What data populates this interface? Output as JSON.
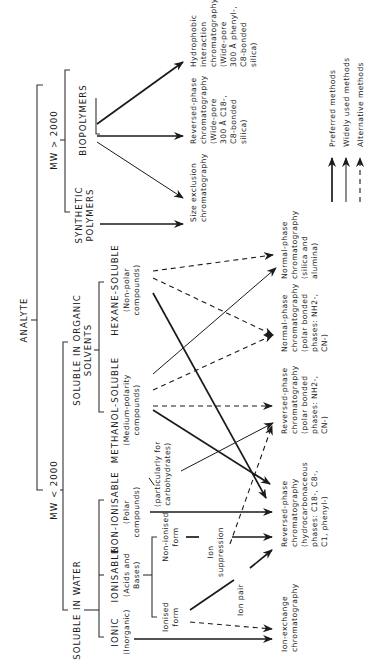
{
  "root": "ANALYTE",
  "branches": {
    "mw_high": "MW > 2000",
    "mw_low": "MW < 2000"
  },
  "categories": {
    "biopolymers": [
      "BIOPOLYMERS"
    ],
    "synthetic": [
      "SYNTHETIC",
      "POLYMERS"
    ],
    "organic": [
      "SOLUBLE IN ORGANIC",
      "SOLVENTS"
    ],
    "water": [
      "SOLUBLE IN WATER"
    ],
    "hexane": [
      "HEXANE-SOLUBLE",
      "(Non-polar",
      "compounds)"
    ],
    "methanol": [
      "METHANOL-SOLUBLE",
      "(Medium-polarity",
      "compounds)"
    ],
    "nonionisable": [
      "NON-IONISABLE",
      "(Polar",
      "compounds)"
    ],
    "ionisable": [
      "IONISABLE",
      "(Acids and",
      "Bases)"
    ],
    "ionic": [
      "IONIC",
      "(Inorganic)"
    ],
    "nonionised": [
      "Non-ionised",
      "form"
    ],
    "ionised": [
      "Ionised",
      "form"
    ]
  },
  "annotations": {
    "ion_suppression": [
      "Ion",
      "suppression"
    ],
    "ion_pair": "Ion pair",
    "carbohydrates": [
      "(particularly for",
      "carbohydrates)"
    ]
  },
  "methods": {
    "hic": [
      "Hydrophobic",
      "interaction",
      "chromatography",
      "(Wide-pore",
      "300 Å phenyl-,",
      "C8-bonded",
      "silica)"
    ],
    "rp_widepore": [
      "Reversed-phase",
      "chromatography",
      "(Wide-pore",
      "300 Å C18-,",
      "C8-bonded",
      "silica)"
    ],
    "sec": [
      "Size exclusion",
      "chromatography"
    ],
    "np_silica": [
      "Normal-phase",
      "chromatography",
      "(silica and",
      "alumina)"
    ],
    "np_bonded": [
      "Normal-phase",
      "chromatography",
      "(polar bonded",
      "phases: NH2-,",
      "CN-)"
    ],
    "rp_polar": [
      "Reversed-phase",
      "chromatography",
      "(polar bonded",
      "phases: NH2-,",
      "CN-)"
    ],
    "rp_hydro": [
      "Reversed-phase",
      "chromatography",
      "(hydrocarbonaceous",
      "phases: C18-, C8-,",
      "C1, phenyl-)"
    ],
    "iex": [
      "Ion-exchange",
      "chromatography"
    ]
  },
  "legend": {
    "preferred": "Preferred methods",
    "widely": "Widely used methods",
    "alternative": "Alternative methods"
  }
}
